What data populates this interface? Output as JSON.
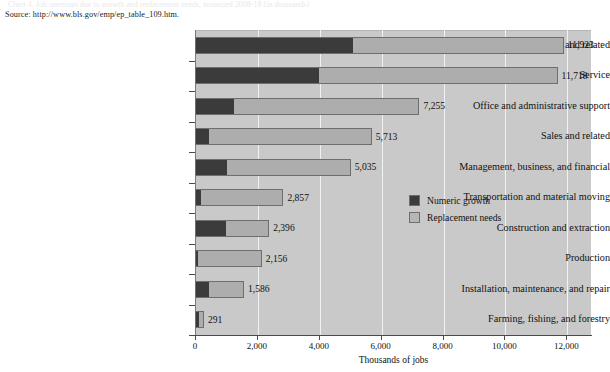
{
  "caption_clipped": "Chart 4. Job openings due to growth and replacement needs, projected 2008-18 (in thousands)",
  "source": "Source: http://www.bls.gov/emp/ep_table_109.htm.",
  "legend": {
    "items": [
      {
        "label": "Numeric growth",
        "color": "#3b3b3b",
        "key": "growth"
      },
      {
        "label": "Replacement needs",
        "color": "#b6b6b6",
        "key": "replacement"
      }
    ]
  },
  "axis": {
    "xlabel": "Thousands of jobs",
    "ticks": [
      "0",
      "2,000",
      "4,000",
      "6,000",
      "8,000",
      "10,000",
      "12,000"
    ]
  },
  "chart_data": {
    "type": "bar",
    "orientation": "horizontal",
    "stacked": true,
    "title": "",
    "xlabel": "Thousands of jobs",
    "ylabel": "",
    "xlim": [
      0,
      12800
    ],
    "grid": true,
    "legend_position": "inside-right",
    "categories": [
      "Professional and related",
      "Service",
      "Office and administrative support",
      "Sales and related",
      "Management, business, and financial",
      "Transportation and material moving",
      "Construction and extraction",
      "Production",
      "Installation, maintenance, and repair",
      "Farming, fishing, and forestry"
    ],
    "series": [
      {
        "name": "Numeric growth",
        "color": "#3b3b3b",
        "values": [
          5100,
          4000,
          1250,
          430,
          1000,
          150,
          1000,
          60,
          450,
          130
        ]
      },
      {
        "name": "Replacement needs",
        "color": "#adadad",
        "values": [
          6823,
          7718,
          6005,
          5283,
          4035,
          2707,
          1396,
          2096,
          1136,
          161
        ]
      }
    ],
    "totals": [
      11923,
      11718,
      7255,
      5713,
      5035,
      2857,
      2396,
      2156,
      1586,
      291
    ],
    "total_labels": [
      "11,923",
      "11,718",
      "7,255",
      "5,713",
      "5,035",
      "2,857",
      "2,396",
      "2,156",
      "1,586",
      "291"
    ]
  }
}
